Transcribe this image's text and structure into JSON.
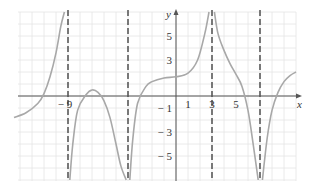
{
  "chart_data": {
    "type": "line",
    "title": "",
    "xlabel": "x",
    "ylabel": "y",
    "x_ticks": [
      "-9",
      "1",
      "3",
      "5"
    ],
    "y_ticks": [
      "5",
      "3",
      "-1",
      "-3",
      "-5"
    ],
    "xlim": [
      -13.5,
      10
    ],
    "ylim": [
      -7,
      7
    ],
    "grid": true,
    "vertical_asymptotes": [
      -9,
      -4,
      3,
      7
    ],
    "series": [
      {
        "name": "f(x)",
        "segments": [
          {
            "x": [
              -13.5,
              -12.5,
              -11.5,
              -11,
              -10.5,
              -10,
              -9.6,
              -9.3
            ],
            "y": [
              -1.8,
              -1.4,
              -0.6,
              0.2,
              1.6,
              3.6,
              5.8,
              7
            ]
          },
          {
            "x": [
              -8.85,
              -8.6,
              -8.2,
              -7.5,
              -7,
              -6.5,
              -6,
              -5.5,
              -5,
              -4.6,
              -4.15
            ],
            "y": [
              -7,
              -4,
              -1.2,
              0.1,
              0.5,
              0.3,
              -0.4,
              -1.8,
              -4,
              -5.8,
              -7
            ]
          },
          {
            "x": [
              -3.85,
              -3.6,
              -3.2,
              -2.5,
              -2,
              -1,
              0,
              1,
              1.8,
              2.4,
              2.75
            ],
            "y": [
              -7,
              -3.6,
              -0.6,
              0.8,
              1.2,
              1.5,
              1.6,
              1.9,
              3,
              5.2,
              7
            ]
          },
          {
            "x": [
              3.2,
              3.5,
              4,
              4.5,
              5,
              5.5,
              6,
              6.4,
              6.85
            ],
            "y": [
              7,
              5.2,
              3.8,
              2.7,
              1.8,
              0.8,
              -1.2,
              -3.8,
              -7
            ]
          },
          {
            "x": [
              7.2,
              7.6,
              8,
              8.5,
              9,
              9.5,
              10
            ],
            "y": [
              -7,
              -3.5,
              -1.2,
              0.3,
              1.2,
              1.7,
              2
            ]
          }
        ]
      }
    ]
  }
}
